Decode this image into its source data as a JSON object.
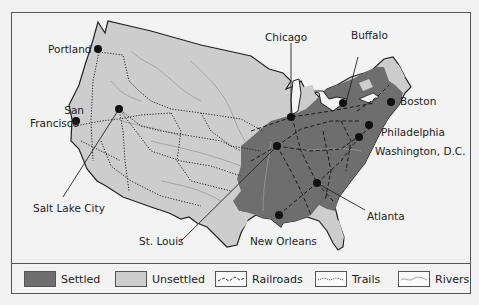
{
  "map": {
    "colors": {
      "settled": "#6e6e6e",
      "unsettled": "#cdcdcd",
      "outline": "#222222",
      "background": "#f3f3f3",
      "rivers": "#9a9a9a",
      "city_dot": "#111111"
    },
    "cities": [
      {
        "name": "Portland",
        "label": "Portland"
      },
      {
        "name": "San Francisco",
        "label_line1": "San",
        "label_line2": "Francisco"
      },
      {
        "name": "Salt Lake City",
        "label": "Salt Lake City"
      },
      {
        "name": "Chicago",
        "label": "Chicago"
      },
      {
        "name": "Buffalo",
        "label": "Buffalo"
      },
      {
        "name": "Boston",
        "label": "Boston"
      },
      {
        "name": "Philadelphia",
        "label": "Philadelphia"
      },
      {
        "name": "Washington, D.C.",
        "label": "Washington, D.C."
      },
      {
        "name": "Atlanta",
        "label": "Atlanta"
      },
      {
        "name": "St. Louis",
        "label": "St. Louis"
      },
      {
        "name": "New Orleans",
        "label": "New Orleans"
      }
    ]
  },
  "legend": {
    "items": [
      {
        "key": "settled",
        "label": "Settled"
      },
      {
        "key": "unsettled",
        "label": "Unsettled"
      },
      {
        "key": "railroads",
        "label": "Railroads"
      },
      {
        "key": "trails",
        "label": "Trails"
      },
      {
        "key": "rivers",
        "label": "Rivers"
      }
    ]
  }
}
